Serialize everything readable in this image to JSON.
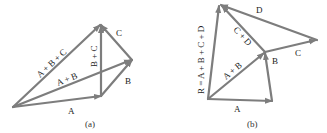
{
  "diagram": {
    "color": "#7d7d7d",
    "panel_a": {
      "caption": "(a)",
      "vectors": [
        {
          "name": "A",
          "label": "A"
        },
        {
          "name": "B",
          "label": "B"
        },
        {
          "name": "C",
          "label": "C"
        },
        {
          "name": "A+B",
          "label": "A + B"
        },
        {
          "name": "B+C",
          "label": "B + C"
        },
        {
          "name": "A+B+C",
          "label": "A + B + C"
        }
      ]
    },
    "panel_b": {
      "caption": "(b)",
      "vectors": [
        {
          "name": "A",
          "label": "A"
        },
        {
          "name": "B",
          "label": "B"
        },
        {
          "name": "C",
          "label": "C"
        },
        {
          "name": "D",
          "label": "D"
        },
        {
          "name": "A+B",
          "label": "A + B"
        },
        {
          "name": "C+D",
          "label": "C + D"
        },
        {
          "name": "R",
          "label": "R = A + B + C + D"
        }
      ]
    }
  }
}
